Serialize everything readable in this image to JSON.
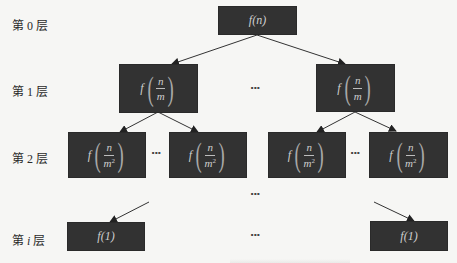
{
  "layers": [
    {
      "prefix": "第",
      "index": "0",
      "suffix": "层",
      "italic": false
    },
    {
      "prefix": "第",
      "index": "1",
      "suffix": "层",
      "italic": false
    },
    {
      "prefix": "第",
      "index": "2",
      "suffix": "层",
      "italic": false
    },
    {
      "prefix": "第",
      "index": "i",
      "suffix": "层",
      "italic": true
    }
  ],
  "nodes": {
    "root": {
      "label": "f(n)"
    },
    "level1": {
      "func": "f",
      "numerator": "n",
      "denominator": "m",
      "exponent": ""
    },
    "level2": {
      "func": "f",
      "numerator": "n",
      "denominator": "m",
      "exponent": "2"
    },
    "leaf": {
      "label": "f(1)"
    }
  },
  "ellipsis": "···",
  "colors": {
    "background": "#f6f6f4",
    "node_fill": "#323232",
    "node_text": "#cfcfcf",
    "arrow": "#333333"
  }
}
